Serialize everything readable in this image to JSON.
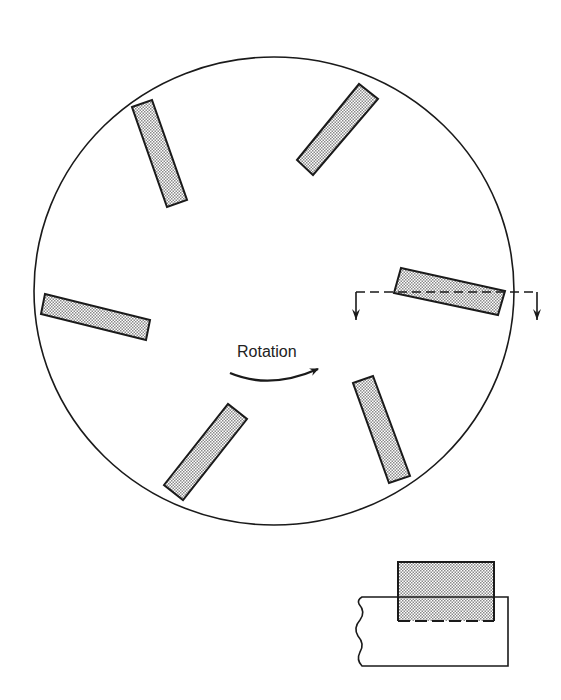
{
  "diagram": {
    "type": "rotating disc with blades (plan view and section view)",
    "colors": {
      "stroke": "#1a1a1a",
      "fill_dots": "#9a9a9a",
      "background": "#ffffff"
    },
    "disc": {
      "cx": 274,
      "cy": 291,
      "rx": 240,
      "ry": 234
    },
    "rotation_label": "Rotation",
    "rotation_arrow": {
      "direction": "clockwise",
      "icon": "curved-arrow-icon"
    },
    "blades": [
      {
        "id": "blade-top-left",
        "points": "132,107 152,100 187,200 167,207"
      },
      {
        "id": "blade-top-right",
        "points": "297,160 359,84 378,99 313,175"
      },
      {
        "id": "blade-left",
        "points": "45,294 150,320 146,340 41,314"
      },
      {
        "id": "blade-bottom-left",
        "points": "164,485 228,404 247,419 183,500"
      },
      {
        "id": "blade-bottom-right",
        "points": "353,383 373,376 410,476 389,483"
      },
      {
        "id": "blade-right-sectioned",
        "points": "401,268 505,291 498,315 394,293"
      }
    ],
    "section_line": {
      "y": 292,
      "x_start": 356,
      "x_end": 537,
      "arrow_length": 30,
      "style": "dashed"
    },
    "section_view": {
      "blade": {
        "x": 398,
        "y": 562,
        "width": 96,
        "height": 59
      },
      "base": {
        "top": 597,
        "bottom": 666,
        "left": 358,
        "right": 508
      },
      "break_edge": "wavy"
    }
  }
}
